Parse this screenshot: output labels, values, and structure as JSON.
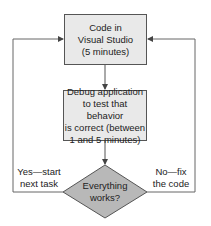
{
  "diagram": {
    "type": "flowchart",
    "nodes": {
      "code": {
        "text": "Code in\nVisual Studio\n(5 minutes)",
        "shape": "rectangle"
      },
      "debug": {
        "text": "Debug application\nto test that behavior\nis correct (between\n1 and 5 minutes)",
        "shape": "rectangle"
      },
      "decision": {
        "text": "Everything\nworks?",
        "shape": "diamond"
      }
    },
    "edges": {
      "yes": {
        "label": "Yes—start\nnext task",
        "from": "decision",
        "to": "code"
      },
      "no": {
        "label": "No—fix\nthe code",
        "from": "decision",
        "to": "code"
      },
      "code_to_debug": {
        "from": "code",
        "to": "debug"
      },
      "debug_to_decision": {
        "from": "debug",
        "to": "decision"
      }
    },
    "colors": {
      "box_fill": "#e9e9e9",
      "diamond_fill": "#b8b8b8",
      "line": "#666666"
    }
  }
}
